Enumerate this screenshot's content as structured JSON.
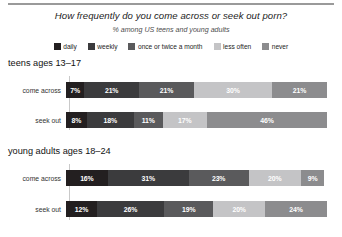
{
  "header": {
    "title": "How frequently do you come across or seek out porn?",
    "subtitle": "% among US teens and young adults"
  },
  "legend": {
    "items": [
      {
        "label": "daily",
        "color": "#231f20"
      },
      {
        "label": "weekly",
        "color": "#3b3b3d"
      },
      {
        "label": "once or twice a month",
        "color": "#5a5a5c"
      },
      {
        "label": "less often",
        "color": "#c4c4c6"
      },
      {
        "label": "never",
        "color": "#8c8c8e"
      }
    ]
  },
  "groups": [
    {
      "title": "teens ages 13–17",
      "rows": [
        {
          "label": "come across",
          "values": [
            7,
            21,
            21,
            30,
            21
          ],
          "labels": [
            "7%",
            "21%",
            "21%",
            "30%",
            "21%"
          ]
        },
        {
          "label": "seek out",
          "values": [
            8,
            18,
            11,
            17,
            46
          ],
          "labels": [
            "8%",
            "18%",
            "11%",
            "17%",
            "46%"
          ]
        }
      ]
    },
    {
      "title": "young adults ages 18–24",
      "rows": [
        {
          "label": "come across",
          "values": [
            16,
            31,
            23,
            20,
            9
          ],
          "labels": [
            "16%",
            "31%",
            "23%",
            "20%",
            "9%"
          ]
        },
        {
          "label": "seek out",
          "values": [
            12,
            26,
            19,
            20,
            24
          ],
          "labels": [
            "12%",
            "26%",
            "19%",
            "20%",
            "24%"
          ]
        }
      ]
    }
  ],
  "chart_data": {
    "type": "bar",
    "title": "How frequently do you come across or seek out porn?",
    "subtitle": "% among US teens and young adults",
    "orientation": "horizontal",
    "stacked": true,
    "stack_total": 100,
    "xlabel": "",
    "ylabel": "",
    "xlim": [
      0,
      100
    ],
    "grid": false,
    "legend_position": "top-center",
    "legend": [
      "daily",
      "weekly",
      "once or twice a month",
      "less often",
      "never"
    ],
    "colors": [
      "#231f20",
      "#3b3b3d",
      "#5a5a5c",
      "#c4c4c6",
      "#8c8c8e"
    ],
    "categories": [
      "teens ages 13–17 / come across",
      "teens ages 13–17 / seek out",
      "young adults ages 18–24 / come across",
      "young adults ages 18–24 / seek out"
    ],
    "series": [
      {
        "name": "daily",
        "values": [
          7,
          8,
          16,
          12
        ]
      },
      {
        "name": "weekly",
        "values": [
          21,
          18,
          31,
          26
        ]
      },
      {
        "name": "once or twice a month",
        "values": [
          21,
          11,
          23,
          19
        ]
      },
      {
        "name": "less often",
        "values": [
          30,
          17,
          20,
          20
        ]
      },
      {
        "name": "never",
        "values": [
          21,
          46,
          9,
          24
        ]
      }
    ]
  }
}
